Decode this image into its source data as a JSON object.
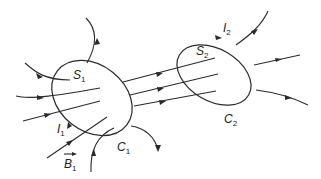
{
  "diagram": {
    "colors": {
      "stroke": "#2a2a2a",
      "background": "#ffffff"
    },
    "labels": {
      "S1": {
        "main": "S",
        "sub": "1"
      },
      "I1": {
        "main": "I",
        "sub": "1"
      },
      "B1": {
        "main": "B",
        "sub": "1",
        "vector_arrow": "→"
      },
      "C1": {
        "main": "C",
        "sub": "1"
      },
      "S2": {
        "main": "S",
        "sub": "2"
      },
      "I2": {
        "main": "I",
        "sub": "2"
      },
      "C2": {
        "main": "C",
        "sub": "2"
      }
    },
    "elements": [
      {
        "id": "loop-C1",
        "type": "closed-curve",
        "label": "C1",
        "surface": "S1",
        "current": "I1"
      },
      {
        "id": "loop-C2",
        "type": "closed-curve",
        "label": "C2",
        "surface": "S2",
        "current": "I2"
      },
      {
        "id": "field-lines",
        "type": "directed-lines",
        "field": "B1",
        "count_between_loops": 3
      }
    ]
  }
}
